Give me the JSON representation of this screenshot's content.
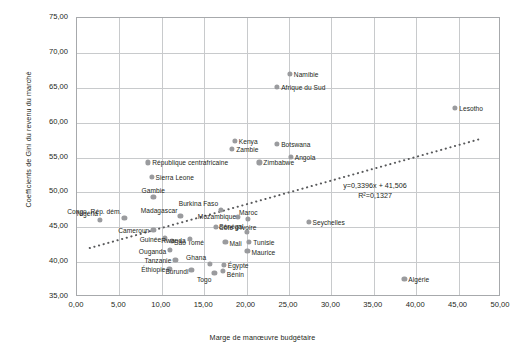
{
  "chart_data": {
    "type": "scatter",
    "title": "",
    "xlabel": "Marge de manœuvre budgétaire",
    "ylabel": "Coefficients de Gini du revenu du marché",
    "xlim": [
      0,
      50
    ],
    "ylim": [
      35,
      75
    ],
    "xticks": [
      "0,00",
      "5,00",
      "10,00",
      "15,00",
      "20,00",
      "25,00",
      "30,00",
      "35,00",
      "40,00",
      "45,00",
      "50,00"
    ],
    "yticks": [
      "35,00",
      "40,00",
      "45,00",
      "50,00",
      "55,00",
      "60,00",
      "65,00",
      "70,00",
      "75,00"
    ],
    "grid": true,
    "legend": "none",
    "point_color": "#9a9b9e",
    "trendline": {
      "equation": "y=0,3396x + 41,506",
      "r2": "R²=0,1327",
      "slope": 0.3396,
      "intercept": 41.506,
      "style": "dotted",
      "color": "#58595b"
    },
    "points": [
      {
        "label": "Nigéria",
        "x": 2.7,
        "y": 46.0,
        "lx": -2,
        "ly": -7,
        "anchor": "end"
      },
      {
        "label": "Congo, Rép. dém.",
        "x": 5.6,
        "y": 46.3,
        "lx": -3,
        "ly": -7,
        "anchor": "end"
      },
      {
        "label": "Cameroun",
        "x": 9.0,
        "y": 44.6,
        "lx": -4,
        "ly": 0,
        "anchor": "end"
      },
      {
        "label": "Gambie",
        "x": 9.0,
        "y": 49.3,
        "lx": 0,
        "ly": -7,
        "anchor": "middle"
      },
      {
        "label": "Sierra Leone",
        "x": 8.8,
        "y": 52.2,
        "lx": 4,
        "ly": 0,
        "anchor": "start"
      },
      {
        "label": "République centrafricaine",
        "x": 8.4,
        "y": 54.3,
        "lx": 4,
        "ly": 0,
        "anchor": "start"
      },
      {
        "label": "Guinée",
        "x": 10.4,
        "y": 43.4,
        "lx": -4,
        "ly": 1,
        "anchor": "end"
      },
      {
        "label": "São Tomé",
        "x": 11.2,
        "y": 43.1,
        "lx": 2,
        "ly": 1,
        "anchor": "start"
      },
      {
        "label": "Ouganda",
        "x": 11.0,
        "y": 41.8,
        "lx": -4,
        "ly": 1,
        "anchor": "end"
      },
      {
        "label": "Éthiopie",
        "x": 10.9,
        "y": 39.0,
        "lx": -4,
        "ly": 0,
        "anchor": "end"
      },
      {
        "label": "Tanzanie",
        "x": 11.6,
        "y": 40.3,
        "lx": -4,
        "ly": 0,
        "anchor": "end"
      },
      {
        "label": "Madagascar",
        "x": 12.2,
        "y": 46.6,
        "lx": -3,
        "ly": -6,
        "anchor": "end"
      },
      {
        "label": "Rwanda",
        "x": 13.3,
        "y": 43.3,
        "lx": -4,
        "ly": 1,
        "anchor": "end"
      },
      {
        "label": "Burundi",
        "x": 13.5,
        "y": 38.9,
        "lx": -3,
        "ly": 1,
        "anchor": "end"
      },
      {
        "label": "Ghana",
        "x": 15.7,
        "y": 39.8,
        "lx": -4,
        "ly": -7,
        "anchor": "end"
      },
      {
        "label": "Togo",
        "x": 16.2,
        "y": 38.5,
        "lx": -3,
        "ly": 6,
        "anchor": "end"
      },
      {
        "label": "Bénin",
        "x": 17.2,
        "y": 38.7,
        "lx": 4,
        "ly": 3,
        "anchor": "start"
      },
      {
        "label": "Égypte",
        "x": 17.3,
        "y": 39.6,
        "lx": 4,
        "ly": 0,
        "anchor": "start"
      },
      {
        "label": "Burkina Faso",
        "x": 17.0,
        "y": 47.5,
        "lx": -3,
        "ly": -7,
        "anchor": "end"
      },
      {
        "label": "Côte d'Ivoire",
        "x": 16.4,
        "y": 45.0,
        "lx": 3,
        "ly": 0,
        "anchor": "start"
      },
      {
        "label": "Mali",
        "x": 17.5,
        "y": 42.9,
        "lx": 4,
        "ly": 1,
        "anchor": "start"
      },
      {
        "label": "Mozambique",
        "x": 19.0,
        "y": 46.5,
        "lx": -2,
        "ly": -1,
        "anchor": "end"
      },
      {
        "label": "Maroc",
        "x": 20.2,
        "y": 46.2,
        "lx": 0,
        "ly": -7,
        "anchor": "middle"
      },
      {
        "label": "Sénégal",
        "x": 20.0,
        "y": 44.3,
        "lx": -3,
        "ly": -6,
        "anchor": "end"
      },
      {
        "label": "Tunisie",
        "x": 20.3,
        "y": 42.9,
        "lx": 4,
        "ly": 0,
        "anchor": "start"
      },
      {
        "label": "Maurice",
        "x": 20.1,
        "y": 41.6,
        "lx": 4,
        "ly": 1,
        "anchor": "start"
      },
      {
        "label": "Kenya",
        "x": 18.6,
        "y": 57.4,
        "lx": 4,
        "ly": 0,
        "anchor": "start"
      },
      {
        "label": "Zambie",
        "x": 18.3,
        "y": 56.2,
        "lx": 4,
        "ly": 0,
        "anchor": "start"
      },
      {
        "label": "Zimbabwe",
        "x": 21.5,
        "y": 54.3,
        "lx": 4,
        "ly": 0,
        "anchor": "start"
      },
      {
        "label": "Botswana",
        "x": 23.6,
        "y": 56.9,
        "lx": 4,
        "ly": 0,
        "anchor": "start"
      },
      {
        "label": "Angola",
        "x": 25.2,
        "y": 55.1,
        "lx": 4,
        "ly": 0,
        "anchor": "start"
      },
      {
        "label": "Namibie",
        "x": 25.1,
        "y": 67.0,
        "lx": 4,
        "ly": 0,
        "anchor": "start"
      },
      {
        "label": "Afrique du Sud",
        "x": 23.6,
        "y": 65.1,
        "lx": 4,
        "ly": 0,
        "anchor": "start"
      },
      {
        "label": "Seychelles",
        "x": 27.3,
        "y": 45.8,
        "lx": 4,
        "ly": 0,
        "anchor": "start"
      },
      {
        "label": "Algérie",
        "x": 38.6,
        "y": 37.6,
        "lx": 4,
        "ly": 0,
        "anchor": "start"
      },
      {
        "label": "Lesotho",
        "x": 44.6,
        "y": 62.1,
        "lx": 4,
        "ly": 0,
        "anchor": "start"
      }
    ]
  }
}
